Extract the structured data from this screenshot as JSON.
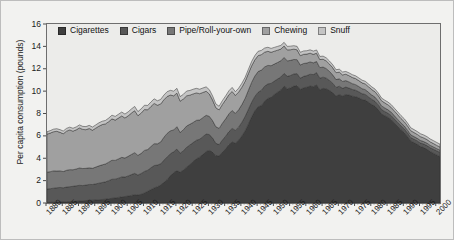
{
  "figure": {
    "background_color": "#f2f2f0",
    "plot_background_color": "#ececea",
    "frame_color": "#6e6e6e"
  },
  "axes": {
    "y_title": "Per capita consumption (pounds)",
    "y_ticks": [
      0,
      2,
      4,
      6,
      8,
      10,
      12,
      14,
      16
    ],
    "y_tick_labels": [
      "0",
      "2",
      "4",
      "6",
      "8",
      "10",
      "12",
      "14",
      "16"
    ],
    "x_tick_labels": [
      "1880",
      "1885",
      "1890",
      "1895",
      "1900",
      "1905",
      "1910",
      "1915",
      "1920",
      "1925",
      "1930",
      "1935",
      "1940",
      "1945",
      "1950",
      "1955",
      "1960",
      "1965",
      "1970",
      "1975",
      "1980",
      "1985",
      "1990",
      "1995",
      "2000"
    ]
  },
  "legend": {
    "position": "top-left-inside",
    "items": [
      {
        "label": "Cigarettes",
        "color": "#3f3f3f"
      },
      {
        "label": "Cigars",
        "color": "#585858"
      },
      {
        "label": "Pipe/Roll-your-own",
        "color": "#777777"
      },
      {
        "label": "Chewing",
        "color": "#a0a0a0"
      },
      {
        "label": "Snuff",
        "color": "#c4c4c4"
      }
    ]
  },
  "chart_data": {
    "type": "area",
    "stacked": true,
    "title": "",
    "xlabel": "",
    "ylabel": "Per capita consumption (pounds)",
    "xlim": [
      1880,
      2001
    ],
    "ylim": [
      0,
      16
    ],
    "grid": false,
    "legend_position": "top-left-inside",
    "x": [
      1880,
      1881,
      1882,
      1883,
      1884,
      1885,
      1886,
      1887,
      1888,
      1889,
      1890,
      1891,
      1892,
      1893,
      1894,
      1895,
      1896,
      1897,
      1898,
      1899,
      1900,
      1901,
      1902,
      1903,
      1904,
      1905,
      1906,
      1907,
      1908,
      1909,
      1910,
      1911,
      1912,
      1913,
      1914,
      1915,
      1916,
      1917,
      1918,
      1919,
      1920,
      1921,
      1922,
      1923,
      1924,
      1925,
      1926,
      1927,
      1928,
      1929,
      1930,
      1931,
      1932,
      1933,
      1934,
      1935,
      1936,
      1937,
      1938,
      1939,
      1940,
      1941,
      1942,
      1943,
      1944,
      1945,
      1946,
      1947,
      1948,
      1949,
      1950,
      1951,
      1952,
      1953,
      1954,
      1955,
      1956,
      1957,
      1958,
      1959,
      1960,
      1961,
      1962,
      1963,
      1964,
      1965,
      1966,
      1967,
      1968,
      1969,
      1970,
      1971,
      1972,
      1973,
      1974,
      1975,
      1976,
      1977,
      1978,
      1979,
      1980,
      1981,
      1982,
      1983,
      1984,
      1985,
      1986,
      1987,
      1988,
      1989,
      1990,
      1991,
      1992,
      1993,
      1994,
      1995,
      1996,
      1997,
      1998,
      1999,
      2000,
      2001
    ],
    "series": [
      {
        "name": "Cigarettes",
        "color": "#3f3f3f",
        "values": [
          0.05,
          0.06,
          0.07,
          0.08,
          0.09,
          0.1,
          0.12,
          0.13,
          0.14,
          0.16,
          0.18,
          0.2,
          0.22,
          0.24,
          0.25,
          0.27,
          0.29,
          0.31,
          0.34,
          0.38,
          0.42,
          0.45,
          0.5,
          0.55,
          0.58,
          0.62,
          0.68,
          0.75,
          0.72,
          0.78,
          0.9,
          1.05,
          1.2,
          1.35,
          1.45,
          1.6,
          1.85,
          2.1,
          2.45,
          2.7,
          2.9,
          2.75,
          2.95,
          3.2,
          3.45,
          3.7,
          3.95,
          4.1,
          4.35,
          4.6,
          4.7,
          4.55,
          4.25,
          4.2,
          4.55,
          4.85,
          5.2,
          5.45,
          5.35,
          5.6,
          6.0,
          6.45,
          7.05,
          7.7,
          8.25,
          8.6,
          8.7,
          9.1,
          9.35,
          9.45,
          9.7,
          9.9,
          10.1,
          10.45,
          10.2,
          10.3,
          10.45,
          10.5,
          10.15,
          10.3,
          10.35,
          10.45,
          10.4,
          10.55,
          10.1,
          10.25,
          10.2,
          10.05,
          9.85,
          9.55,
          9.7,
          9.55,
          9.7,
          9.65,
          9.55,
          9.5,
          9.4,
          9.25,
          9.2,
          9.0,
          8.8,
          8.65,
          8.35,
          7.95,
          7.8,
          7.65,
          7.45,
          7.15,
          6.85,
          6.55,
          6.3,
          5.95,
          5.55,
          5.4,
          5.25,
          5.05,
          4.95,
          4.8,
          4.6,
          4.45,
          4.3,
          4.15
        ]
      },
      {
        "name": "Cigars",
        "color": "#585858",
        "values": [
          1.2,
          1.22,
          1.25,
          1.28,
          1.3,
          1.26,
          1.3,
          1.33,
          1.35,
          1.38,
          1.4,
          1.36,
          1.38,
          1.42,
          1.4,
          1.44,
          1.48,
          1.52,
          1.55,
          1.62,
          1.7,
          1.68,
          1.72,
          1.78,
          1.74,
          1.8,
          1.86,
          1.9,
          1.78,
          1.86,
          1.92,
          1.88,
          1.95,
          2.0,
          1.94,
          1.9,
          1.98,
          2.02,
          1.95,
          1.88,
          1.92,
          1.7,
          1.72,
          1.78,
          1.74,
          1.7,
          1.66,
          1.6,
          1.58,
          1.56,
          1.42,
          1.25,
          1.08,
          1.02,
          1.08,
          1.12,
          1.18,
          1.22,
          1.14,
          1.18,
          1.22,
          1.28,
          1.32,
          1.3,
          1.28,
          1.3,
          1.38,
          1.34,
          1.3,
          1.24,
          1.2,
          1.18,
          1.16,
          1.14,
          1.12,
          1.1,
          1.08,
          1.06,
          1.0,
          1.02,
          1.04,
          1.06,
          1.08,
          1.1,
          1.05,
          1.0,
          0.96,
          0.9,
          0.84,
          0.78,
          0.74,
          0.7,
          0.66,
          0.62,
          0.6,
          0.58,
          0.54,
          0.52,
          0.5,
          0.48,
          0.46,
          0.44,
          0.42,
          0.4,
          0.38,
          0.37,
          0.36,
          0.35,
          0.34,
          0.33,
          0.32,
          0.31,
          0.3,
          0.3,
          0.3,
          0.31,
          0.32,
          0.33,
          0.34,
          0.35,
          0.36,
          0.37
        ]
      },
      {
        "name": "Pipe/Roll-your-own",
        "color": "#777777",
        "values": [
          1.5,
          1.52,
          1.55,
          1.5,
          1.48,
          1.45,
          1.5,
          1.52,
          1.48,
          1.5,
          1.55,
          1.52,
          1.5,
          1.48,
          1.45,
          1.5,
          1.55,
          1.58,
          1.6,
          1.65,
          1.7,
          1.68,
          1.72,
          1.75,
          1.7,
          1.75,
          1.8,
          1.85,
          1.75,
          1.8,
          1.88,
          1.85,
          1.9,
          1.95,
          1.9,
          1.95,
          2.05,
          2.1,
          2.05,
          1.95,
          2.0,
          1.85,
          1.88,
          1.9,
          1.85,
          1.8,
          1.78,
          1.72,
          1.7,
          1.68,
          1.62,
          1.55,
          1.48,
          1.45,
          1.5,
          1.55,
          1.58,
          1.6,
          1.52,
          1.55,
          1.58,
          1.62,
          1.7,
          1.78,
          1.82,
          1.85,
          1.8,
          1.72,
          1.65,
          1.58,
          1.52,
          1.48,
          1.45,
          1.42,
          1.38,
          1.35,
          1.3,
          1.25,
          1.18,
          1.15,
          1.12,
          1.1,
          1.05,
          1.0,
          0.95,
          0.9,
          0.85,
          0.8,
          0.75,
          0.7,
          0.66,
          0.62,
          0.58,
          0.55,
          0.52,
          0.5,
          0.47,
          0.45,
          0.43,
          0.41,
          0.39,
          0.37,
          0.35,
          0.33,
          0.32,
          0.31,
          0.3,
          0.29,
          0.28,
          0.27,
          0.26,
          0.25,
          0.24,
          0.24,
          0.23,
          0.23,
          0.22,
          0.22,
          0.21,
          0.21,
          0.2,
          0.2
        ]
      },
      {
        "name": "Chewing",
        "color": "#a0a0a0",
        "values": [
          3.4,
          3.45,
          3.5,
          3.55,
          3.45,
          3.38,
          3.5,
          3.55,
          3.45,
          3.5,
          3.58,
          3.5,
          3.45,
          3.52,
          3.4,
          3.48,
          3.55,
          3.6,
          3.58,
          3.62,
          3.7,
          3.6,
          3.65,
          3.7,
          3.58,
          3.62,
          3.7,
          3.75,
          3.55,
          3.6,
          3.65,
          3.55,
          3.58,
          3.6,
          3.45,
          3.4,
          3.35,
          3.3,
          3.2,
          3.05,
          3.0,
          2.8,
          2.75,
          2.7,
          2.6,
          2.55,
          2.45,
          2.35,
          2.25,
          2.15,
          2.0,
          1.85,
          1.7,
          1.65,
          1.68,
          1.7,
          1.72,
          1.7,
          1.6,
          1.58,
          1.55,
          1.52,
          1.5,
          1.48,
          1.45,
          1.42,
          1.38,
          1.32,
          1.26,
          1.2,
          1.15,
          1.1,
          1.05,
          1.02,
          0.98,
          0.95,
          0.92,
          0.88,
          0.84,
          0.82,
          0.8,
          0.78,
          0.76,
          0.74,
          0.72,
          0.7,
          0.68,
          0.66,
          0.64,
          0.62,
          0.6,
          0.58,
          0.57,
          0.56,
          0.55,
          0.54,
          0.53,
          0.52,
          0.51,
          0.5,
          0.49,
          0.48,
          0.47,
          0.46,
          0.45,
          0.44,
          0.43,
          0.42,
          0.41,
          0.4,
          0.39,
          0.38,
          0.37,
          0.36,
          0.35,
          0.34,
          0.33,
          0.32,
          0.31,
          0.3,
          0.29,
          0.28
        ]
      },
      {
        "name": "Snuff",
        "color": "#c4c4c4",
        "values": [
          0.22,
          0.22,
          0.23,
          0.23,
          0.24,
          0.24,
          0.25,
          0.25,
          0.26,
          0.26,
          0.27,
          0.27,
          0.28,
          0.28,
          0.29,
          0.29,
          0.3,
          0.3,
          0.31,
          0.32,
          0.33,
          0.33,
          0.34,
          0.35,
          0.35,
          0.36,
          0.37,
          0.38,
          0.37,
          0.38,
          0.39,
          0.39,
          0.4,
          0.41,
          0.4,
          0.41,
          0.42,
          0.43,
          0.42,
          0.42,
          0.43,
          0.41,
          0.42,
          0.43,
          0.42,
          0.42,
          0.41,
          0.4,
          0.4,
          0.39,
          0.38,
          0.36,
          0.34,
          0.33,
          0.34,
          0.35,
          0.35,
          0.36,
          0.34,
          0.35,
          0.35,
          0.36,
          0.37,
          0.38,
          0.38,
          0.39,
          0.38,
          0.37,
          0.36,
          0.35,
          0.34,
          0.34,
          0.33,
          0.33,
          0.32,
          0.32,
          0.31,
          0.31,
          0.3,
          0.3,
          0.3,
          0.3,
          0.29,
          0.29,
          0.28,
          0.28,
          0.28,
          0.27,
          0.27,
          0.26,
          0.26,
          0.26,
          0.25,
          0.25,
          0.25,
          0.25,
          0.24,
          0.24,
          0.24,
          0.24,
          0.24,
          0.24,
          0.24,
          0.24,
          0.24,
          0.25,
          0.25,
          0.25,
          0.26,
          0.26,
          0.26,
          0.26,
          0.26,
          0.26,
          0.26,
          0.26,
          0.26,
          0.26,
          0.26,
          0.26,
          0.26,
          0.26
        ]
      }
    ]
  }
}
